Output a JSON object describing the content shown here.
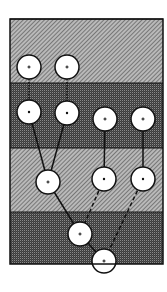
{
  "diagram": {
    "width": 167,
    "height": 292,
    "frame": {
      "x": 10,
      "y": 19,
      "width": 153,
      "height": 245
    },
    "bands": [
      {
        "id": "band-1",
        "y": 19,
        "height": 64,
        "shade": "light-hatch"
      },
      {
        "id": "band-2",
        "y": 83,
        "height": 65,
        "shade": "dark-check"
      },
      {
        "id": "band-3",
        "y": 148,
        "height": 64,
        "shade": "light-hatch"
      },
      {
        "id": "band-4",
        "y": 212,
        "height": 52,
        "shade": "dark-check"
      }
    ],
    "colors": {
      "light_band_base": "#b9b9b9",
      "light_band_stripe": "#5a5a5a",
      "dark_band_base": "#3c3c3c",
      "dark_band_dot": "#8a8a8a",
      "node_fill": "#ffffff",
      "stroke": "#111111"
    },
    "node_radius": 12,
    "nodes": [
      {
        "id": "n1",
        "x": 29,
        "y": 67,
        "mark": "+"
      },
      {
        "id": "n2",
        "x": 67,
        "y": 67,
        "mark": "+"
      },
      {
        "id": "n3",
        "x": 29,
        "y": 112,
        "mark": "•"
      },
      {
        "id": "n4",
        "x": 67,
        "y": 113,
        "mark": "•"
      },
      {
        "id": "n5",
        "x": 105,
        "y": 119,
        "mark": "+"
      },
      {
        "id": "n6",
        "x": 143,
        "y": 119,
        "mark": "+"
      },
      {
        "id": "n7",
        "x": 48,
        "y": 182,
        "mark": "+"
      },
      {
        "id": "n8",
        "x": 104,
        "y": 179,
        "mark": "•"
      },
      {
        "id": "n9",
        "x": 143,
        "y": 179,
        "mark": "•"
      },
      {
        "id": "n10",
        "x": 80,
        "y": 234,
        "mark": "+"
      },
      {
        "id": "n11",
        "x": 104,
        "y": 261,
        "mark": "+"
      }
    ],
    "edges": [
      {
        "from": "n1",
        "to": "n3",
        "style": "dotted"
      },
      {
        "from": "n2",
        "to": "n4",
        "style": "dotted"
      },
      {
        "from": "n3",
        "to": "n7",
        "style": "solid"
      },
      {
        "from": "n4",
        "to": "n7",
        "style": "solid"
      },
      {
        "from": "n5",
        "to": "n8",
        "style": "solid"
      },
      {
        "from": "n6",
        "to": "n9",
        "style": "solid"
      },
      {
        "from": "n7",
        "to": "n10",
        "style": "solid"
      },
      {
        "from": "n8",
        "to": "n10",
        "style": "dashed"
      },
      {
        "from": "n9",
        "to": "n11",
        "style": "dashed"
      },
      {
        "from": "n10",
        "to": "n11",
        "style": "solid"
      }
    ]
  }
}
